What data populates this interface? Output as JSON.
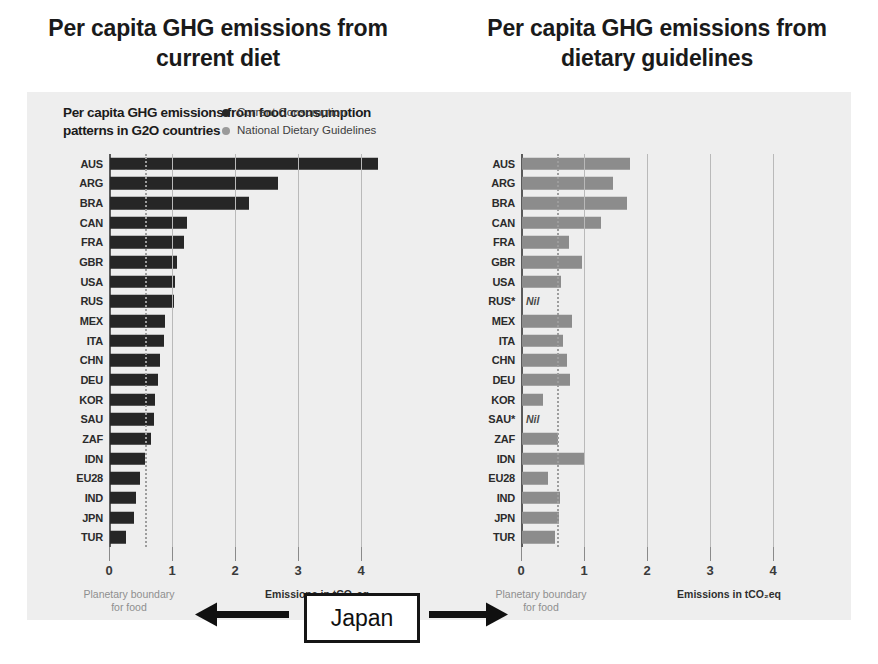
{
  "slide": {
    "title_left": "Per capita GHG emissions from current diet",
    "title_right": "Per capita GHG emissions from dietary guidelines"
  },
  "figure": {
    "headline": "Per capita GHG emissions from food consumption patterns in G2O countries",
    "legend": [
      {
        "label": "Current Consumption",
        "color": "#262626",
        "icon": "legend-dot-current"
      },
      {
        "label": "National Dietary Guidelines",
        "color": "#8c8c8c",
        "icon": "legend-dot-guidelines"
      }
    ],
    "callout": {
      "label": "Japan",
      "arrow_left": "arrow-left-icon",
      "arrow_right": "arrow-right-icon"
    },
    "axis": {
      "tick_labels": [
        "0",
        "1",
        "2",
        "3",
        "4"
      ],
      "caption_boundary": "Planetary boundary",
      "caption_boundary_line2": "for food",
      "caption_emissions": "Emissions in tCO₂eq",
      "planetary_boundary_value": 0.57
    }
  },
  "chart_data": [
    {
      "type": "bar",
      "orientation": "horizontal",
      "id": "current-diet",
      "title": "Per capita GHG emissions from food consumption patterns in G2O countries",
      "series_name": "Current Consumption",
      "xlabel": "Emissions in tCO₂eq",
      "ylabel": "",
      "xlim": [
        0,
        4.25
      ],
      "xticks": [
        0,
        1,
        2,
        3,
        4
      ],
      "grid": true,
      "legend_position": "top-right",
      "annotations": [
        {
          "text": "Planetary boundary for food",
          "x": 0.57,
          "style": "dotted-vertical"
        }
      ],
      "categories": [
        "AUS",
        "ARG",
        "BRA",
        "CAN",
        "FRA",
        "GBR",
        "USA",
        "RUS",
        "MEX",
        "ITA",
        "CHN",
        "DEU",
        "KOR",
        "SAU",
        "ZAF",
        "IDN",
        "EU28",
        "IND",
        "JPN",
        "TUR"
      ],
      "values": [
        4.25,
        2.67,
        2.21,
        1.22,
        1.18,
        1.07,
        1.03,
        1.02,
        0.87,
        0.85,
        0.79,
        0.76,
        0.71,
        0.69,
        0.65,
        0.55,
        0.48,
        0.41,
        0.38,
        0.26
      ]
    },
    {
      "type": "bar",
      "orientation": "horizontal",
      "id": "dietary-guidelines",
      "title": "Per capita GHG emissions from food consumption patterns in G2O countries",
      "series_name": "National Dietary Guidelines",
      "xlabel": "Emissions in tCO₂eq",
      "ylabel": "",
      "xlim": [
        0,
        4.25
      ],
      "xticks": [
        0,
        1,
        2,
        3,
        4
      ],
      "grid": true,
      "legend_position": "top-right",
      "annotations": [
        {
          "text": "Planetary boundary for food",
          "x": 0.57,
          "style": "dotted-vertical"
        }
      ],
      "categories": [
        "AUS",
        "ARG",
        "BRA",
        "CAN",
        "FRA",
        "GBR",
        "USA",
        "RUS*",
        "MEX",
        "ITA",
        "CHN",
        "DEU",
        "KOR",
        "SAU*",
        "ZAF",
        "IDN",
        "EU28",
        "IND",
        "JPN",
        "TUR"
      ],
      "values": [
        1.72,
        1.45,
        1.67,
        1.25,
        0.74,
        0.95,
        0.62,
        null,
        0.8,
        0.65,
        0.72,
        0.76,
        0.34,
        null,
        0.57,
        0.98,
        0.42,
        0.6,
        0.58,
        0.53
      ],
      "null_label": "Nil"
    }
  ]
}
